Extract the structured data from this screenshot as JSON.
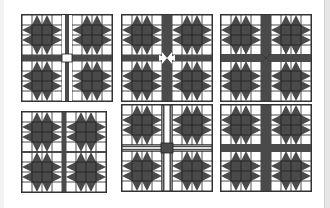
{
  "figure": {
    "colors": {
      "dark": "#4a4a4a",
      "light": "#ffffff",
      "line": "#1e1e1e",
      "frame": "#333333"
    },
    "panels": [
      {
        "id": 1,
        "row": 0,
        "col": 0,
        "x": 21,
        "y": 14,
        "sashing": "vertical-striped-horizontal-dark",
        "center": "white-square"
      },
      {
        "id": 2,
        "row": 0,
        "col": 1,
        "x": 121,
        "y": 14,
        "sashing": "dark-arrow-points",
        "center": "white-star"
      },
      {
        "id": 3,
        "row": 0,
        "col": 2,
        "x": 220,
        "y": 14,
        "sashing": "dark-wide",
        "center": "dark-diagonal"
      },
      {
        "id": 4,
        "row": 1,
        "col": 0,
        "x": 21,
        "y": 111,
        "sashing": "dark-thin",
        "center": "dark"
      },
      {
        "id": 5,
        "row": 1,
        "col": 1,
        "x": 121,
        "y": 104,
        "sashing": "white-strips-dark-edges",
        "center": "dark-square"
      },
      {
        "id": 6,
        "row": 1,
        "col": 2,
        "x": 220,
        "y": 104,
        "sashing": "dark-wide",
        "center": "dark"
      }
    ]
  }
}
